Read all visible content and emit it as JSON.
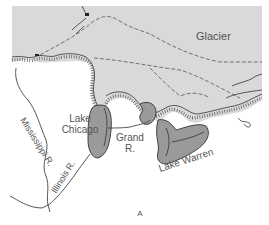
{
  "figure": {
    "panel_label": "A",
    "labels": {
      "glacier": "Glacier",
      "lake_chicago": [
        "Lake",
        "Chicago"
      ],
      "grand_river": [
        "Grand",
        "R."
      ],
      "lake_warren": "Lake Warren",
      "mississippi": "Mississippi R.",
      "illinois": "Illinois R."
    },
    "colors": {
      "glacier": "#d9d9d9",
      "lake": "#9a9a9a",
      "line": "#333333",
      "text": "#555555",
      "background": "#ffffff"
    }
  }
}
